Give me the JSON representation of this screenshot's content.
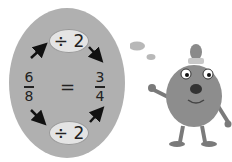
{
  "diagram": {
    "left_fraction": {
      "numerator": "6",
      "denominator": "8"
    },
    "right_fraction": {
      "numerator": "3",
      "denominator": "4"
    },
    "equals": "=",
    "top_operation": "÷ 2",
    "bottom_operation": "÷ 2"
  },
  "colors": {
    "oval": "#b0b0b0",
    "pill": "#e4e4e4",
    "text": "#222222"
  }
}
